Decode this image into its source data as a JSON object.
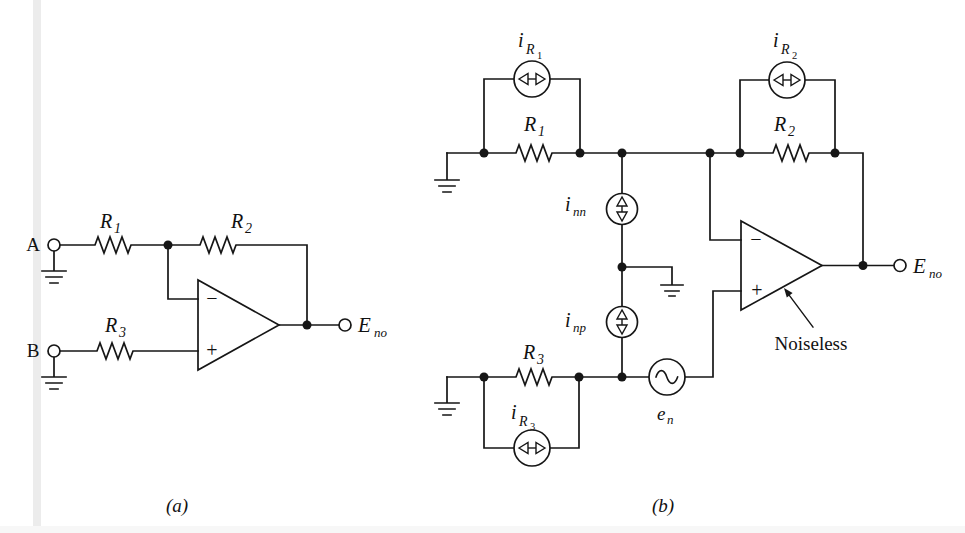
{
  "figure": {
    "background": "#ffffff",
    "line_color": "#161616",
    "gutter_color": "#ececec"
  },
  "circuit_a": {
    "caption": "(a)",
    "input_a_label": "A",
    "input_b_label": "B",
    "r1": {
      "base": "R",
      "sub": "1"
    },
    "r2": {
      "base": "R",
      "sub": "2"
    },
    "r3": {
      "base": "R",
      "sub": "3"
    },
    "opamp_minus": "−",
    "opamp_plus": "+",
    "output": {
      "base": "E",
      "sub": "no"
    }
  },
  "circuit_b": {
    "caption": "(b)",
    "r1": {
      "base": "R",
      "sub": "1"
    },
    "r2": {
      "base": "R",
      "sub": "2"
    },
    "r3": {
      "base": "R",
      "sub": "3"
    },
    "i_r1": {
      "base": "i",
      "sub": "R",
      "subsub": "1"
    },
    "i_r2": {
      "base": "i",
      "sub": "R",
      "subsub": "2"
    },
    "i_r3": {
      "base": "i",
      "sub": "R",
      "subsub": "3"
    },
    "i_nn": {
      "base": "i",
      "sub": "nn"
    },
    "i_np": {
      "base": "i",
      "sub": "np"
    },
    "e_n": {
      "base": "e",
      "sub": "n"
    },
    "noiseless": "Noiseless",
    "opamp_minus": "−",
    "opamp_plus": "+",
    "output": {
      "base": "E",
      "sub": "no"
    }
  }
}
